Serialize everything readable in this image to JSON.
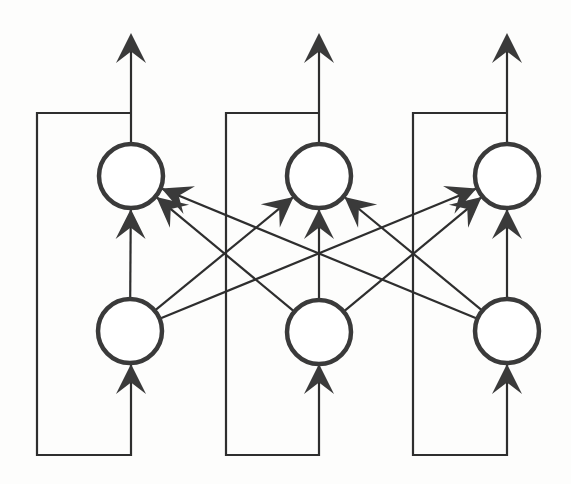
{
  "diagram": {
    "type": "recurrent-neural-network",
    "colors": {
      "background": "#fdfdfc",
      "stroke": "#2e2e2e",
      "node_stroke": "#3a3a3a",
      "node_fill": "#ffffff"
    },
    "node_radius": 32,
    "layers": {
      "hidden": [
        {
          "id": "h1",
          "x": 131,
          "y": 176
        },
        {
          "id": "h2",
          "x": 319,
          "y": 176
        },
        {
          "id": "h3",
          "x": 507,
          "y": 176
        }
      ],
      "input": [
        {
          "id": "i1",
          "x": 130,
          "y": 331
        },
        {
          "id": "i2",
          "x": 319,
          "y": 332
        },
        {
          "id": "i3",
          "x": 507,
          "y": 331
        }
      ]
    },
    "outputs": [
      {
        "from": "h1",
        "tip_y": 33
      },
      {
        "from": "h2",
        "tip_y": 33
      },
      {
        "from": "h3",
        "tip_y": 33
      }
    ],
    "feedback_loops": [
      {
        "column": "1",
        "left_x": 37,
        "top_y": 113,
        "bottom_y": 455,
        "node_x": 131
      },
      {
        "column": "2",
        "left_x": 226,
        "top_y": 113,
        "bottom_y": 455,
        "node_x": 319
      },
      {
        "column": "3",
        "left_x": 413,
        "top_y": 113,
        "bottom_y": 455,
        "node_x": 507
      }
    ],
    "edges": [
      {
        "from": "i1",
        "to": "h1"
      },
      {
        "from": "i1",
        "to": "h2"
      },
      {
        "from": "i1",
        "to": "h3"
      },
      {
        "from": "i2",
        "to": "h1"
      },
      {
        "from": "i2",
        "to": "h2"
      },
      {
        "from": "i2",
        "to": "h3"
      },
      {
        "from": "i3",
        "to": "h1"
      },
      {
        "from": "i3",
        "to": "h2"
      },
      {
        "from": "i3",
        "to": "h3"
      }
    ]
  }
}
